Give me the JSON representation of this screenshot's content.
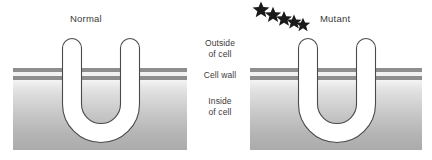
{
  "figure": {
    "title_left": "Normal",
    "title_right": "Mutant",
    "background_color": "#ffffff"
  },
  "labels": {
    "outside": "Outside\nof cell",
    "cell_wall": "Cell wall",
    "inside": "Inside\nof cell"
  },
  "panels": [
    {
      "id": "normal",
      "title": "Normal",
      "x": 13,
      "width": 174,
      "has_stars": false
    },
    {
      "id": "mutant",
      "title": "Mutant",
      "x": 250,
      "width": 172,
      "has_stars": true
    }
  ],
  "transporter": {
    "shape": "u-channel",
    "fill_color": "#ffffff",
    "stroke_color": "#4a4a4a"
  },
  "cell_wall": {
    "band_color": "#8e8e8e",
    "band_count": 2
  },
  "cytoplasm": {
    "gradient_top": "#f4f4f4",
    "gradient_bottom": "#ababab"
  },
  "stars": {
    "count": 5,
    "color": "#1a1a1a",
    "meaning": "mutation-markers"
  }
}
